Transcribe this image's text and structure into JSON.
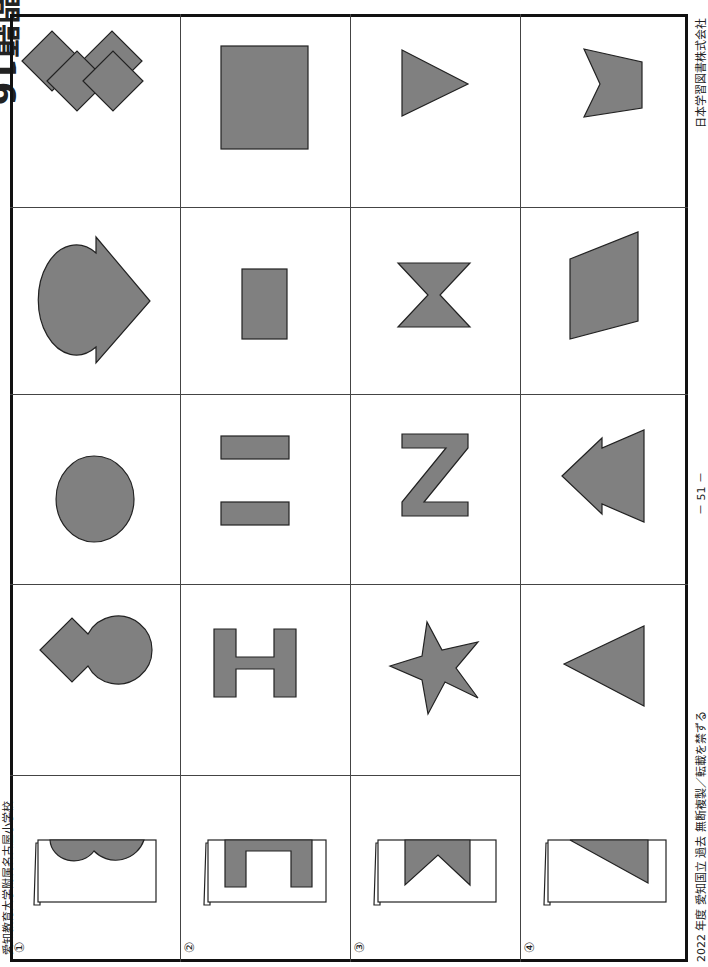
{
  "page": {
    "title": "問題16",
    "school": "愛知教育大学附属名古屋小学校",
    "footer_left": "2022 年度 愛知国立 過去 無断複製／転載を禁ずる",
    "footer_center": "－ 51 －",
    "footer_right": "日本学習図書株式会社"
  },
  "colors": {
    "shape_fill": "#808080",
    "shape_stroke": "#222222",
    "frame": "#111111",
    "grid": "#444444"
  },
  "questions": [
    {
      "number": "①",
      "folded_paper": "two-semicircles-on-fold",
      "choices": [
        "double-diamond",
        "circle-with-arrow-triangle",
        "two-overlapping-circles",
        "diamond-and-circle"
      ]
    },
    {
      "number": "②",
      "folded_paper": "inverted-u-on-fold",
      "choices": [
        "square",
        "tall-rectangle",
        "two-vertical-bars",
        "letter-h"
      ]
    },
    {
      "number": "③",
      "folded_paper": "notched-triangle-on-fold",
      "choices": [
        "triangle-pointing-right",
        "bowtie",
        "letter-n",
        "star"
      ]
    },
    {
      "number": "④",
      "folded_paper": "right-triangle-on-fold",
      "choices": [
        "notched-quadrilateral",
        "parallelogram",
        "double-arrow-triangle",
        "triangle-pointing-left"
      ]
    }
  ]
}
